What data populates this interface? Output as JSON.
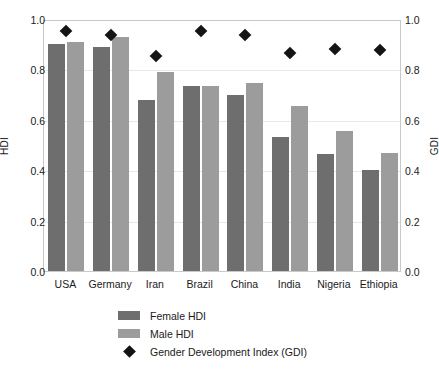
{
  "chart_data": {
    "type": "bar",
    "title": "",
    "xlabel": "",
    "ylabel": "HDI",
    "y2label": "GDI",
    "ylim": [
      0.0,
      1.0
    ],
    "y2lim": [
      0.0,
      1.0
    ],
    "grid": true,
    "legend_position": "bottom",
    "categories": [
      "USA",
      "Germany",
      "Iran",
      "Brazil",
      "China",
      "India",
      "Nigeria",
      "Ethiopia"
    ],
    "yticks": [
      "0.0",
      "0.2",
      "0.4",
      "0.6",
      "0.8",
      "1.0"
    ],
    "y2ticks": [
      "0.0",
      "0.2",
      "0.4",
      "0.6",
      "0.8",
      "1.0"
    ],
    "series": [
      {
        "name": "Female HDI",
        "type": "bar",
        "axis": "left",
        "color": "#6e6e6e",
        "values": [
          0.9,
          0.89,
          0.68,
          0.735,
          0.7,
          0.53,
          0.465,
          0.4
        ]
      },
      {
        "name": "Male HDI",
        "type": "bar",
        "axis": "left",
        "color": "#9c9c9c",
        "values": [
          0.91,
          0.93,
          0.79,
          0.735,
          0.745,
          0.655,
          0.555,
          0.47
        ]
      },
      {
        "name": "Gender Development Index (GDI)",
        "type": "scatter",
        "marker": "diamond",
        "axis": "right",
        "color": "#141414",
        "values": [
          0.96,
          0.945,
          0.86,
          0.96,
          0.945,
          0.875,
          0.89,
          0.885
        ]
      }
    ]
  },
  "legend": {
    "items": [
      {
        "label": "Female HDI",
        "swatch": "female"
      },
      {
        "label": "Male HDI",
        "swatch": "male"
      },
      {
        "label": "Gender Development Index (GDI)",
        "swatch": "diamond"
      }
    ]
  }
}
